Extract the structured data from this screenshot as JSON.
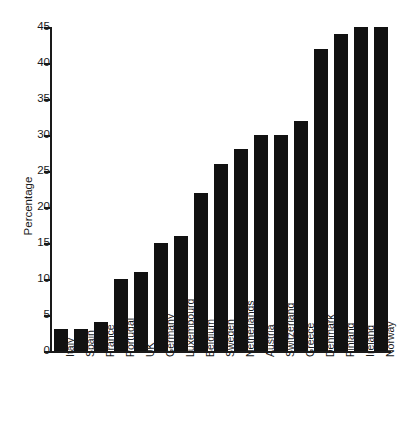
{
  "chart_data": {
    "type": "bar",
    "title": "",
    "subtitle": "",
    "xlabel": "",
    "ylabel": "Percentage",
    "ylim": [
      0,
      45
    ],
    "ytick_interval": 5,
    "yticks": [
      0,
      5,
      10,
      15,
      20,
      25,
      30,
      35,
      40,
      45
    ],
    "ytick_labels": [
      "0",
      "5",
      "10",
      "15",
      "20",
      "25",
      "30",
      "35",
      "40",
      "45"
    ],
    "grid": false,
    "legend": false,
    "bar_color": "#111111",
    "background_color": "#ffffff",
    "axis_color": "#1a1a1a",
    "xlabel_rotation": 90,
    "categories": [
      "Italy",
      "Spain",
      "France",
      "Portugal",
      "UK",
      "Germany",
      "Luxembourg",
      "Belgium",
      "Sweden",
      "Netherlands",
      "Austria",
      "Switzerland",
      "Greece",
      "Denmark",
      "Finland",
      "Ireland",
      "Norway"
    ],
    "values": [
      3,
      3,
      4,
      10,
      11,
      15,
      16,
      22,
      26,
      28,
      30,
      30,
      32,
      42,
      44,
      45,
      45
    ]
  }
}
